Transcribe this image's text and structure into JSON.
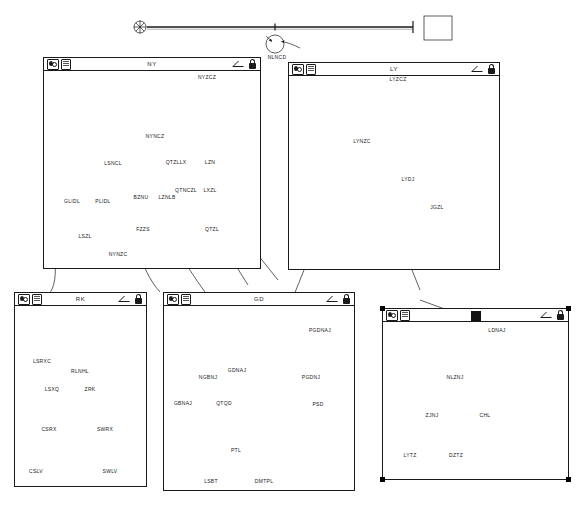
{
  "app": {
    "title": "Model Window Workspace",
    "canvas_background": "#ffffff",
    "line_color": "#1a1a1a"
  },
  "icons": {
    "left_first": "model-toggle-icon",
    "left_second": "document-icon",
    "right_first": "collapse-triangle-icon",
    "right_second": "lock-icon",
    "selected_marker": "selected-document-icon"
  },
  "root_diagram": {
    "name": "top-level-chain",
    "nodes": [
      {
        "id": "root-source",
        "shape": "starburst",
        "x": 140,
        "y": 27,
        "r": 6,
        "label": ""
      },
      {
        "id": "root-junction",
        "shape": "tick",
        "x": 275,
        "y": 27,
        "label": ""
      },
      {
        "id": "root-circle",
        "shape": "circle",
        "x": 275,
        "y": 44,
        "r": 9,
        "label": "NLNCD"
      },
      {
        "id": "root-box",
        "shape": "box",
        "x": 424,
        "y": 16,
        "w": 28,
        "h": 24,
        "label": ""
      }
    ],
    "label": "NLNCD"
  },
  "windows": [
    {
      "id": "win-ny",
      "title": "NY",
      "x": 43,
      "y": 57,
      "w": 218,
      "h": 212,
      "selected": false,
      "titlebar_icons": [
        "model-toggle-icon",
        "document-icon",
        "collapse-triangle-icon",
        "lock-icon"
      ],
      "top_chain": {
        "source_label": "",
        "box_label": "NYZCZ"
      },
      "nodes": [
        {
          "id": "ny-1",
          "label": "NYNCZ",
          "x": 155,
          "y": 125,
          "r": 9
        },
        {
          "id": "ny-2",
          "label": "LSNCL",
          "x": 113,
          "y": 152,
          "r": 8
        },
        {
          "id": "ny-3",
          "label": "QTZLLX",
          "x": 176,
          "y": 152,
          "r": 8
        },
        {
          "id": "ny-4",
          "label": "LZN",
          "x": 209,
          "y": 152,
          "r": 8
        },
        {
          "id": "ny-5",
          "label": "GLIDL",
          "x": 73,
          "y": 190,
          "r": 8
        },
        {
          "id": "ny-6",
          "label": "PLIDL",
          "x": 103,
          "y": 190,
          "r": 8
        },
        {
          "id": "ny-7",
          "label": "BZNU",
          "x": 143,
          "y": 186,
          "r": 8
        },
        {
          "id": "ny-8",
          "label": "LZNLB",
          "x": 166,
          "y": 186,
          "r": 7
        },
        {
          "id": "ny-9",
          "label": "QTNCZL",
          "x": 186,
          "y": 180,
          "r": 7
        },
        {
          "id": "ny-10",
          "label": "LXZL",
          "x": 209,
          "y": 180,
          "r": 7
        },
        {
          "id": "ny-11",
          "label": "LSZL",
          "x": 85,
          "y": 225,
          "r": 8
        },
        {
          "id": "ny-12",
          "label": "NYNZC",
          "x": 118,
          "y": 243,
          "r": 8
        },
        {
          "id": "ny-13",
          "label": "FZZS",
          "x": 143,
          "y": 218,
          "r": 8
        },
        {
          "id": "ny-14",
          "label": "QTZL",
          "x": 211,
          "y": 218,
          "r": 8
        }
      ]
    },
    {
      "id": "win-ly",
      "title": "LY",
      "x": 288,
      "y": 62,
      "w": 212,
      "h": 208,
      "selected": false,
      "titlebar_icons": [
        "model-toggle-icon",
        "document-icon",
        "collapse-triangle-icon",
        "lock-icon"
      ],
      "top_chain": {
        "source_label": "",
        "box_label": "LYZCZ"
      },
      "nodes": [
        {
          "id": "ly-1",
          "label": "LYNZC",
          "x": 363,
          "y": 130,
          "r": 9
        },
        {
          "id": "ly-2",
          "label": "LYDJ",
          "x": 408,
          "y": 168,
          "r": 8
        },
        {
          "id": "ly-3",
          "label": "JGZL",
          "x": 437,
          "y": 196,
          "r": 8
        }
      ]
    },
    {
      "id": "win-rk",
      "title": "RK",
      "x": 14,
      "y": 292,
      "w": 133,
      "h": 195,
      "selected": false,
      "titlebar_icons": [
        "model-toggle-icon",
        "document-icon",
        "collapse-triangle-icon",
        "lock-icon"
      ],
      "box_label": "ZRK",
      "nodes": [
        {
          "id": "rk-1",
          "label": "LSRXC",
          "x": 44,
          "y": 353,
          "r": 8
        },
        {
          "id": "rk-2",
          "label": "RLNHL",
          "x": 79,
          "y": 360,
          "r": 8
        },
        {
          "id": "rk-3",
          "label": "LSXQ",
          "x": 53,
          "y": 378,
          "r": 8
        },
        {
          "id": "rk-4",
          "label": "CSRX",
          "x": 48,
          "y": 417,
          "r": 8
        },
        {
          "id": "rk-5",
          "label": "SWRX",
          "x": 104,
          "y": 417,
          "r": 8
        },
        {
          "id": "rk-6",
          "label": "CSLV",
          "x": 36,
          "y": 457,
          "r": 9
        },
        {
          "id": "rk-7",
          "label": "SWLV",
          "x": 110,
          "y": 457,
          "r": 9
        }
      ]
    },
    {
      "id": "win-gd",
      "title": "GD",
      "x": 163,
      "y": 292,
      "w": 192,
      "h": 199,
      "selected": false,
      "titlebar_icons": [
        "model-toggle-icon",
        "document-icon",
        "collapse-triangle-icon",
        "lock-icon"
      ],
      "box_labels": [
        "GDNAJ",
        "PGDNAJ"
      ],
      "nodes": [
        {
          "id": "gd-1",
          "label": "NGBNJ",
          "x": 209,
          "y": 366,
          "r": 8
        },
        {
          "id": "gd-2",
          "label": "GBNAJ",
          "x": 183,
          "y": 392,
          "r": 8
        },
        {
          "id": "gd-3",
          "label": "QTQD",
          "x": 224,
          "y": 392,
          "r": 8
        },
        {
          "id": "gd-4",
          "label": "PGDNJ",
          "x": 311,
          "y": 366,
          "r": 8
        },
        {
          "id": "gd-5",
          "label": "PSD",
          "x": 318,
          "y": 393,
          "r": 8
        },
        {
          "id": "gd-6",
          "label": "PTL",
          "x": 237,
          "y": 438,
          "r": 9
        },
        {
          "id": "gd-7",
          "label": "LSBT",
          "x": 211,
          "y": 468,
          "r": 8
        },
        {
          "id": "gd-8",
          "label": "DMTPL",
          "x": 264,
          "y": 468,
          "r": 8
        }
      ]
    },
    {
      "id": "win-selected",
      "title": "",
      "x": 382,
      "y": 308,
      "w": 187,
      "h": 172,
      "selected": true,
      "titlebar_icons": [
        "model-toggle-icon",
        "document-icon",
        "selected-document-icon",
        "collapse-triangle-icon",
        "lock-icon"
      ],
      "box_label": "LDNAJ",
      "nodes": [
        {
          "id": "sel-1",
          "label": "NLZNJ",
          "x": 459,
          "y": 366,
          "r": 9
        },
        {
          "id": "sel-2",
          "label": "ZJNJ",
          "x": 433,
          "y": 404,
          "r": 8
        },
        {
          "id": "sel-3",
          "label": "CHL",
          "x": 485,
          "y": 404,
          "r": 8
        },
        {
          "id": "sel-4",
          "label": "LYTZ",
          "x": 410,
          "y": 443,
          "r": 8
        },
        {
          "id": "sel-5",
          "label": "DZTZ",
          "x": 456,
          "y": 443,
          "r": 8
        }
      ]
    }
  ]
}
